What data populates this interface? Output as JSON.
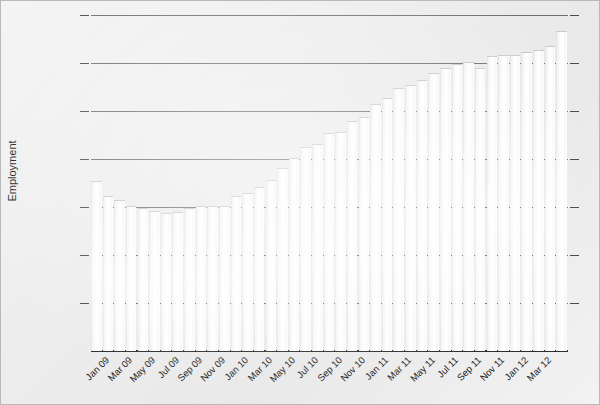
{
  "chart_data": {
    "type": "bar",
    "title": "",
    "subtitle": "",
    "xlabel": "",
    "ylabel": "Employment",
    "ylim": [
      16200,
      17600
    ],
    "ytick_step": 200,
    "ytick_labels": [
      "17 600",
      "17 400",
      "17 200",
      "17 000",
      "16 800",
      "16 600",
      "16 400",
      "16 200"
    ],
    "ytick_values": [
      17600,
      17400,
      17200,
      17000,
      16800,
      16600,
      16400,
      16200
    ],
    "grid": "horizontal",
    "legend": "none",
    "bar_color": "#fafafa",
    "bar_edge_color": "#c9c9c9",
    "gridline_color": "#6f6f6f",
    "axis_color": "#2e2e2e",
    "background_color": "#eeeeee",
    "categories": [
      "Jan 09",
      "Feb 09",
      "Mar 09",
      "Apr 09",
      "May 09",
      "Jun 09",
      "Jul 09",
      "Aug 09",
      "Sep 09",
      "Oct 09",
      "Nov 09",
      "Dec 09",
      "Jan 10",
      "Feb 10",
      "Mar 10",
      "Apr 10",
      "May 10",
      "Jun 10",
      "Jul 10",
      "Aug 10",
      "Sep 10",
      "Oct 10",
      "Nov 10",
      "Dec 10",
      "Jan 11",
      "Feb 11",
      "Mar 11",
      "Apr 11",
      "May 11",
      "Jun 11",
      "Jul 11",
      "Aug 11",
      "Sep 11",
      "Oct 11",
      "Nov 11",
      "Dec 11",
      "Jan 12",
      "Feb 12",
      "Mar 12",
      "Apr 12",
      "May 12"
    ],
    "xtick_labels": [
      "Jan 09",
      "Mar 09",
      "May 09",
      "Jul 09",
      "Sep 09",
      "Nov 09",
      "Jan 10",
      "Mar 10",
      "May 10",
      "Jul 10",
      "Sep 10",
      "Nov 10",
      "Jan 11",
      "Mar 11",
      "May 11",
      "Jul 11",
      "Sep 11",
      "Nov 11",
      "Jan 12",
      "Mar 12"
    ],
    "xtick_indices": [
      0,
      2,
      4,
      6,
      8,
      10,
      12,
      14,
      16,
      18,
      20,
      22,
      24,
      26,
      28,
      30,
      32,
      34,
      36,
      38
    ],
    "values": [
      16905,
      16840,
      16825,
      16800,
      16790,
      16780,
      16770,
      16775,
      16790,
      16800,
      16800,
      16800,
      16840,
      16855,
      16880,
      16910,
      16960,
      17000,
      17045,
      17060,
      17105,
      17110,
      17155,
      17170,
      17225,
      17250,
      17290,
      17305,
      17325,
      17355,
      17375,
      17390,
      17400,
      17375,
      17425,
      17430,
      17430,
      17440,
      17450,
      17465,
      17530
    ]
  }
}
